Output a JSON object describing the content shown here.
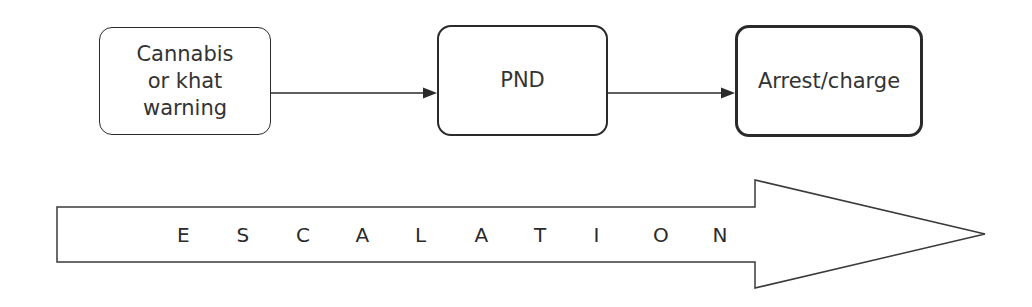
{
  "diagram": {
    "type": "escalation-flow",
    "nodes": [
      {
        "id": "warning",
        "label": "Cannabis\nor khat\nwarning",
        "border_weight": "thin"
      },
      {
        "id": "pnd",
        "label": "PND",
        "border_weight": "medium"
      },
      {
        "id": "arrest",
        "label": "Arrest/charge",
        "border_weight": "thick"
      }
    ],
    "edges": [
      {
        "from": "warning",
        "to": "pnd"
      },
      {
        "from": "pnd",
        "to": "arrest"
      }
    ],
    "escalation_arrow": {
      "label": "ESCALATION",
      "letters": [
        "E",
        "S",
        "C",
        "A",
        "L",
        "A",
        "T",
        "I",
        "O",
        "N"
      ],
      "direction": "right"
    }
  },
  "colors": {
    "stroke": "#2a2a2a",
    "text": "#333333",
    "background": "#ffffff"
  }
}
